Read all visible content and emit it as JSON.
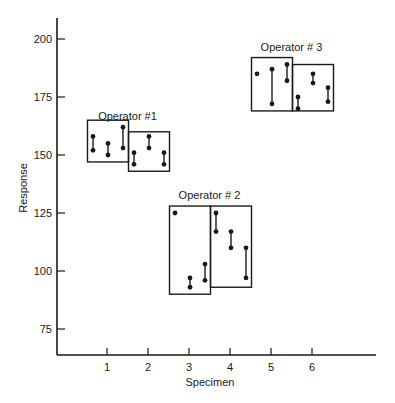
{
  "chart_data": {
    "type": "scatter",
    "subtype": "range-plot-by-operator",
    "title": "",
    "xlabel": "Specimen",
    "ylabel": "Response",
    "x_ticks": [
      1,
      2,
      3,
      4,
      5,
      6
    ],
    "y_ticks": [
      75,
      100,
      125,
      150,
      175,
      200
    ],
    "ylim": [
      64,
      207
    ],
    "xlim": [
      0,
      7.5
    ],
    "grid": false,
    "legend": null,
    "operators": [
      {
        "name": "Operator #1",
        "label_pos": {
          "specimen": 1.5,
          "value": 165
        },
        "specimens": [
          {
            "specimen": 1,
            "box": {
              "low": 147,
              "high": 165
            },
            "measurements": [
              [
                158,
                152
              ],
              [
                155,
                150
              ],
              [
                162,
                153
              ]
            ]
          },
          {
            "specimen": 2,
            "box": {
              "low": 143,
              "high": 160
            },
            "measurements": [
              [
                151,
                146
              ],
              [
                158,
                153
              ],
              [
                151,
                146
              ]
            ]
          }
        ]
      },
      {
        "name": "Operator # 2",
        "label_pos": {
          "specimen": 3.5,
          "value": 131
        },
        "specimens": [
          {
            "specimen": 3,
            "box": {
              "low": 90,
              "high": 128
            },
            "measurements": [
              [
                125,
                125
              ],
              [
                97,
                93
              ],
              [
                103,
                96
              ]
            ]
          },
          {
            "specimen": 4,
            "box": {
              "low": 93,
              "high": 128
            },
            "measurements": [
              [
                125,
                117
              ],
              [
                117,
                110
              ],
              [
                110,
                97
              ]
            ]
          }
        ]
      },
      {
        "name": "Operator # 3",
        "label_pos": {
          "specimen": 5.5,
          "value": 195
        },
        "specimens": [
          {
            "specimen": 5,
            "box": {
              "low": 169,
              "high": 192
            },
            "measurements": [
              [
                185,
                185
              ],
              [
                187,
                172
              ],
              [
                189,
                182
              ]
            ]
          },
          {
            "specimen": 6,
            "box": {
              "low": 169,
              "high": 189
            },
            "measurements": [
              [
                175,
                170
              ],
              [
                185,
                181
              ],
              [
                179,
                173
              ]
            ]
          }
        ]
      }
    ]
  },
  "labels": {
    "xlabel": "Specimen",
    "ylabel": "Response"
  }
}
